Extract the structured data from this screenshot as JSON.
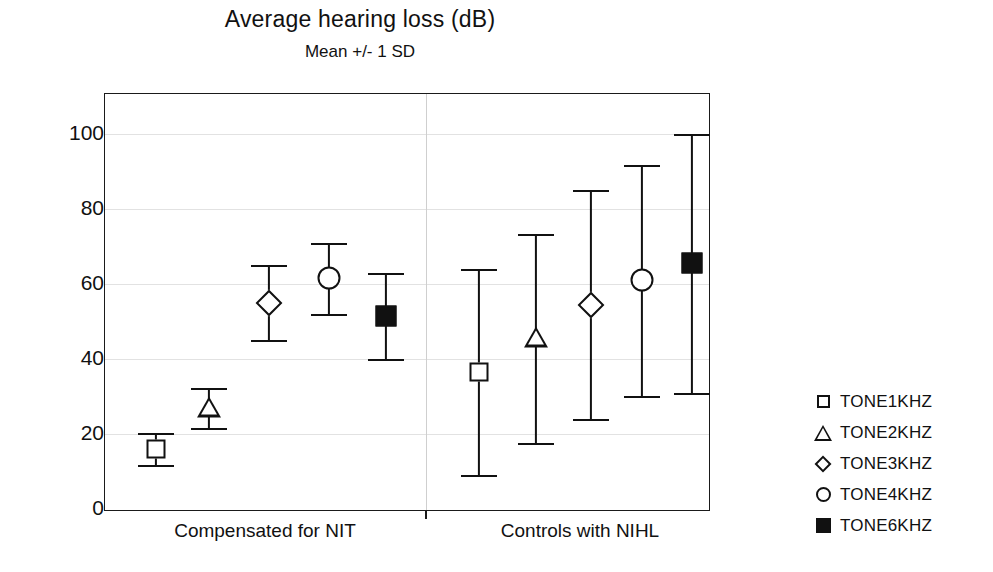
{
  "chart_data": {
    "type": "scatter",
    "title": "Average hearing loss (dB)",
    "subtitle": "Mean +/- 1 SD",
    "xlabel": "",
    "ylabel": "",
    "ylim": [
      0,
      110
    ],
    "yticks": [
      0,
      20,
      40,
      60,
      80,
      100
    ],
    "ytick_labels": [
      "0",
      "20",
      "40",
      "60",
      "80",
      "100"
    ],
    "grid": true,
    "legend_position": "right",
    "categories": [
      "Compensated for NIT",
      "Controls with NIHL"
    ],
    "series": [
      {
        "name": "TONE1KHZ",
        "marker": "open-square",
        "means": [
          16.0,
          36.5
        ],
        "sds": [
          4.2,
          27.5
        ],
        "lower": [
          11.8,
          9.0
        ],
        "upper": [
          20.2,
          64.0
        ]
      },
      {
        "name": "TONE2KHZ",
        "marker": "open-triangle",
        "means": [
          27.0,
          45.5
        ],
        "sds": [
          5.3,
          27.9
        ],
        "lower": [
          21.7,
          17.6
        ],
        "upper": [
          32.3,
          73.4
        ]
      },
      {
        "name": "TONE3KHZ",
        "marker": "open-diamond",
        "means": [
          55.0,
          54.5
        ],
        "sds": [
          10.0,
          30.5
        ],
        "lower": [
          45.0,
          24.0
        ],
        "upper": [
          65.0,
          85.0
        ]
      },
      {
        "name": "TONE4KHZ",
        "marker": "open-circle",
        "means": [
          61.5,
          61.0
        ],
        "sds": [
          9.5,
          30.8
        ],
        "lower": [
          52.0,
          30.2
        ],
        "upper": [
          71.0,
          91.8
        ]
      },
      {
        "name": "TONE6KHZ",
        "marker": "filled-square",
        "means": [
          51.5,
          65.5
        ],
        "sds": [
          11.5,
          34.5
        ],
        "lower": [
          40.0,
          31.0
        ],
        "upper": [
          63.0,
          100.0
        ]
      }
    ]
  },
  "legend": {
    "items": [
      {
        "label": "TONE1KHZ",
        "marker": "open-square-icon"
      },
      {
        "label": "TONE2KHZ",
        "marker": "open-triangle-icon"
      },
      {
        "label": "TONE3KHZ",
        "marker": "open-diamond-icon"
      },
      {
        "label": "TONE4KHZ",
        "marker": "open-circle-icon"
      },
      {
        "label": "TONE6KHZ",
        "marker": "filled-square-icon"
      }
    ]
  },
  "colors": {
    "ink": "#111111",
    "grid": "#e2e2e2",
    "frame": "#1a1a1a",
    "background": "#ffffff"
  }
}
